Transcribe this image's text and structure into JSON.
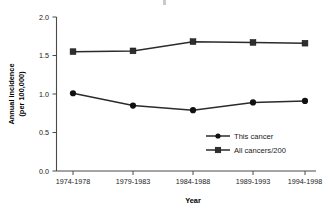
{
  "chart_data": {
    "type": "line",
    "title": "",
    "xlabel": "Year",
    "ylabel": "Annual incidence (per 100,000)",
    "ylabel_line1": "Annual incidence",
    "ylabel_line2": "(per 100,000)",
    "categories": [
      "1974-1978",
      "1979-1983",
      "1984-1988",
      "1989-1993",
      "1994-1998"
    ],
    "ylim": [
      0.0,
      2.0
    ],
    "yticks": [
      "0.0",
      "0.5",
      "1.0",
      "1.5",
      "2.0"
    ],
    "ytick_values": [
      0.0,
      0.5,
      1.0,
      1.5,
      2.0
    ],
    "grid": false,
    "legend_position": "inside-lower-right",
    "series": [
      {
        "name": "This cancer",
        "marker": "circle",
        "color": "#111111",
        "values": [
          1.01,
          0.85,
          0.79,
          0.89,
          0.91
        ]
      },
      {
        "name": "All cancers/200",
        "marker": "square",
        "color": "#2e2e2e",
        "values": [
          1.55,
          1.56,
          1.68,
          1.67,
          1.66
        ]
      }
    ]
  },
  "colors": {
    "background": "#ffffff",
    "axis": "#4a4a4a",
    "line": "#2b2b2b",
    "text": "#1a1a1a"
  }
}
